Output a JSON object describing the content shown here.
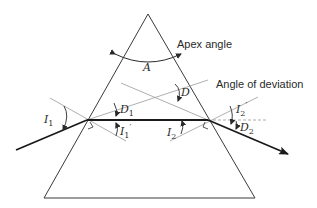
{
  "diagram": {
    "labels": {
      "apex_angle": "Apex angle",
      "angle_of_deviation": "Angle of deviation",
      "apex_symbol": "A",
      "deviation_symbol": "D",
      "I1": "I",
      "I1_sub": "1",
      "I1p": "I",
      "I1p_sub": "1",
      "I1p_prime": "′",
      "D1": "D",
      "D1_sub": "1",
      "I2": "I",
      "I2_sub": "2",
      "I2p": "I",
      "I2p_sub": "2",
      "I2p_prime": "′",
      "D2": "D",
      "D2_sub": "2"
    },
    "colors": {
      "prism_edge": "#3a3a3a",
      "ray": "#1a1a1a",
      "normal_dashed": "#9a9a9a",
      "text": "#2a2a2a",
      "background": "#ffffff"
    },
    "geometry": {
      "apex": [
        148,
        14
      ],
      "base_left": [
        44,
        198
      ],
      "base_right": [
        255,
        198
      ],
      "entry_point": [
        87,
        120
      ],
      "exit_point": [
        208,
        120
      ],
      "incident_start": [
        16,
        150
      ],
      "emergent_end": [
        288,
        154
      ]
    }
  }
}
